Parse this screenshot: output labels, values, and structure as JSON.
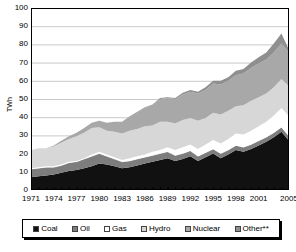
{
  "chart_data": {
    "type": "area",
    "stacked": true,
    "title": "",
    "subtitle": "",
    "xlabel": "",
    "ylabel": "TWh",
    "ylim": [
      0,
      100
    ],
    "ytick_values": [
      0,
      10,
      20,
      30,
      40,
      50,
      60,
      70,
      80,
      90,
      100
    ],
    "ytick_labels": [
      "0",
      "10",
      "20",
      "30",
      "40",
      "50",
      "60",
      "70",
      "80",
      "90",
      "100"
    ],
    "xlim": [
      1971,
      2005
    ],
    "xtick_values": [
      1971,
      1974,
      1977,
      1980,
      1983,
      1986,
      1989,
      1992,
      1995,
      1998,
      2001,
      2005
    ],
    "xtick_labels": [
      "1971",
      "1974",
      "1977",
      "1980",
      "1983",
      "1986",
      "1989",
      "1992",
      "1995",
      "1998",
      "2001",
      "2005"
    ],
    "grid": "horizontal",
    "legend_position": "bottom",
    "x": [
      1971,
      1972,
      1973,
      1974,
      1975,
      1976,
      1977,
      1978,
      1979,
      1980,
      1981,
      1982,
      1983,
      1984,
      1985,
      1986,
      1987,
      1988,
      1989,
      1990,
      1991,
      1992,
      1993,
      1994,
      1995,
      1996,
      1997,
      1998,
      1999,
      2000,
      2001,
      2002,
      2003,
      2004,
      2005
    ],
    "series": [
      {
        "name": "Coal",
        "color": "#111111",
        "values": [
          7.0,
          7.5,
          8.0,
          8.5,
          9.5,
          10.5,
          11.0,
          12.0,
          13.0,
          14.5,
          14.0,
          13.0,
          12.0,
          12.5,
          13.5,
          14.5,
          15.5,
          16.5,
          17.5,
          16.0,
          17.0,
          18.5,
          16.0,
          18.0,
          20.0,
          17.5,
          19.5,
          22.0,
          21.0,
          22.5,
          24.5,
          26.5,
          29.0,
          32.0,
          27.0
        ]
      },
      {
        "name": "Oil",
        "color": "#7d7d7d",
        "values": [
          4.5,
          4.5,
          4.5,
          4.0,
          4.0,
          4.5,
          4.5,
          5.0,
          5.5,
          5.5,
          4.5,
          4.0,
          3.5,
          3.5,
          3.5,
          3.5,
          3.5,
          3.5,
          3.5,
          3.0,
          3.0,
          3.0,
          2.5,
          2.5,
          2.5,
          2.5,
          2.5,
          2.5,
          2.5,
          2.5,
          2.5,
          2.5,
          2.5,
          2.5,
          2.5
        ]
      },
      {
        "name": "Gas",
        "color": "#ffffff",
        "values": [
          0.5,
          0.5,
          0.5,
          0.5,
          0.5,
          0.5,
          0.5,
          0.5,
          1.0,
          1.0,
          1.0,
          1.0,
          1.0,
          1.5,
          1.5,
          1.5,
          2.0,
          2.0,
          2.5,
          3.0,
          3.5,
          3.5,
          4.0,
          4.5,
          5.0,
          5.5,
          6.0,
          6.5,
          7.0,
          7.5,
          8.0,
          8.5,
          9.5,
          10.5,
          11.0
        ]
      },
      {
        "name": "Hydro",
        "color": "#d7d7d7",
        "values": [
          10.0,
          10.5,
          10.0,
          11.0,
          12.0,
          12.5,
          13.5,
          14.0,
          14.5,
          13.5,
          13.0,
          14.0,
          14.5,
          15.0,
          15.0,
          15.5,
          14.5,
          15.5,
          14.0,
          14.5,
          15.0,
          14.5,
          15.5,
          14.5,
          15.0,
          16.0,
          15.5,
          15.0,
          16.0,
          16.5,
          16.0,
          15.5,
          15.5,
          16.0,
          16.5
        ]
      },
      {
        "name": "Nuclear",
        "color": "#a8a8a8",
        "values": [
          0.0,
          0.0,
          0.0,
          0.5,
          1.0,
          1.5,
          2.0,
          2.5,
          3.0,
          3.5,
          4.5,
          5.5,
          6.5,
          8.0,
          9.5,
          10.5,
          11.5,
          12.5,
          13.0,
          13.5,
          14.0,
          14.5,
          15.0,
          15.5,
          16.0,
          16.5,
          16.5,
          17.0,
          17.5,
          18.0,
          18.5,
          18.5,
          19.0,
          19.5,
          18.5
        ]
      },
      {
        "name": "Other**",
        "color": "#8f8f8f",
        "values": [
          0.0,
          0.0,
          0.0,
          0.0,
          0.0,
          0.0,
          0.0,
          0.0,
          0.0,
          0.0,
          0.0,
          0.0,
          0.0,
          0.0,
          0.0,
          0.0,
          0.0,
          0.5,
          0.5,
          0.5,
          1.0,
          1.0,
          1.0,
          1.5,
          1.5,
          2.0,
          2.0,
          2.5,
          2.5,
          3.0,
          3.5,
          4.0,
          5.0,
          5.5,
          1.5
        ]
      }
    ],
    "totals": [
      22.0,
      23.0,
      23.0,
      24.5,
      27.0,
      29.5,
      31.5,
      34.0,
      37.0,
      38.0,
      37.0,
      37.5,
      37.5,
      40.5,
      43.0,
      45.5,
      47.0,
      50.5,
      51.0,
      50.5,
      53.5,
      55.0,
      54.0,
      56.5,
      60.0,
      60.0,
      62.0,
      65.5,
      66.5,
      70.0,
      73.0,
      75.5,
      80.5,
      86.0,
      77.0
    ]
  },
  "legend": {
    "items": [
      {
        "label": "Coal",
        "color": "#111111"
      },
      {
        "label": "Oil",
        "color": "#7d7d7d"
      },
      {
        "label": "Gas",
        "color": "#ffffff"
      },
      {
        "label": "Hydro",
        "color": "#d7d7d7"
      },
      {
        "label": "Nuclear",
        "color": "#a8a8a8"
      },
      {
        "label": "Other**",
        "color": "#8f8f8f"
      }
    ]
  },
  "style": {
    "plot_border": "#000000",
    "gridline_color": "#c9c9c9",
    "axis_text_color": "#000000",
    "background": "#ffffff"
  }
}
